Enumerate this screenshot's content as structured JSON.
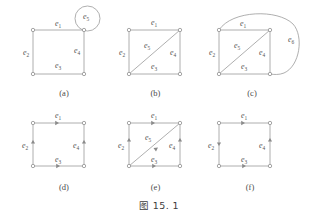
{
  "figure": {
    "caption": "图 15. 1",
    "caption_prefix": "图",
    "caption_number": "15. 1"
  },
  "labels": {
    "e1": "e",
    "e2": "e",
    "e3": "e",
    "e4": "e",
    "e5": "e",
    "e6": "e",
    "sub1": "1",
    "sub2": "2",
    "sub3": "3",
    "sub4": "4",
    "sub5": "5",
    "sub6": "6"
  },
  "colors": {
    "edge": "#9a9a9a",
    "vertex_stroke": "#8f8f8f",
    "vertex_fill": "#ffffff",
    "label": "#555555",
    "caption": "#3d3d3d",
    "background": "#ffffff"
  },
  "panels": [
    {
      "id": "a",
      "caption": "(a)",
      "type": "undirected",
      "description": "rectangle with self-loop at top-right vertex",
      "vertices": [
        "top-left",
        "top-right",
        "bottom-left",
        "bottom-right"
      ],
      "edges": [
        {
          "name": "e1",
          "label": "e",
          "sub": "1",
          "from": "top-left",
          "to": "top-right",
          "shape": "straight"
        },
        {
          "name": "e2",
          "label": "e",
          "sub": "2",
          "from": "top-left",
          "to": "bottom-left",
          "shape": "straight"
        },
        {
          "name": "e3",
          "label": "e",
          "sub": "3",
          "from": "bottom-left",
          "to": "bottom-right",
          "shape": "straight"
        },
        {
          "name": "e4",
          "label": "e",
          "sub": "4",
          "from": "top-right",
          "to": "bottom-right",
          "shape": "straight"
        },
        {
          "name": "e5",
          "label": "e",
          "sub": "5",
          "from": "top-right",
          "to": "top-right",
          "shape": "self-loop"
        }
      ]
    },
    {
      "id": "b",
      "caption": "(b)",
      "type": "undirected",
      "description": "rectangle with diagonal from bottom-left to top-right",
      "vertices": [
        "top-left",
        "top-right",
        "bottom-left",
        "bottom-right"
      ],
      "edges": [
        {
          "name": "e1",
          "label": "e",
          "sub": "1",
          "from": "top-left",
          "to": "top-right",
          "shape": "straight"
        },
        {
          "name": "e2",
          "label": "e",
          "sub": "2",
          "from": "top-left",
          "to": "bottom-left",
          "shape": "straight"
        },
        {
          "name": "e3",
          "label": "e",
          "sub": "3",
          "from": "bottom-left",
          "to": "bottom-right",
          "shape": "straight"
        },
        {
          "name": "e4",
          "label": "e",
          "sub": "4",
          "from": "top-right",
          "to": "bottom-right",
          "shape": "straight"
        },
        {
          "name": "e5",
          "label": "e",
          "sub": "5",
          "from": "bottom-left",
          "to": "top-right",
          "shape": "diagonal"
        }
      ]
    },
    {
      "id": "c",
      "caption": "(c)",
      "type": "undirected",
      "description": "rectangle with diagonal and large curved edge from top-left around to bottom-right",
      "vertices": [
        "top-left",
        "top-right",
        "bottom-left",
        "bottom-right"
      ],
      "edges": [
        {
          "name": "e1",
          "label": "e",
          "sub": "1",
          "from": "top-left",
          "to": "top-right",
          "shape": "straight"
        },
        {
          "name": "e2",
          "label": "e",
          "sub": "2",
          "from": "top-left",
          "to": "bottom-left",
          "shape": "straight"
        },
        {
          "name": "e3",
          "label": "e",
          "sub": "3",
          "from": "bottom-left",
          "to": "bottom-right",
          "shape": "straight"
        },
        {
          "name": "e4",
          "label": "e",
          "sub": "4",
          "from": "top-right",
          "to": "bottom-right",
          "shape": "straight"
        },
        {
          "name": "e5",
          "label": "e",
          "sub": "5",
          "from": "bottom-left",
          "to": "top-right",
          "shape": "diagonal"
        },
        {
          "name": "e6",
          "label": "e",
          "sub": "6",
          "from": "top-left",
          "to": "bottom-right",
          "shape": "outer-curve"
        }
      ]
    },
    {
      "id": "d",
      "caption": "(d)",
      "type": "directed",
      "description": "directed rectangle without diagonal",
      "vertices": [
        "top-left",
        "top-right",
        "bottom-left",
        "bottom-right"
      ],
      "edges": [
        {
          "name": "e1",
          "label": "e",
          "sub": "1",
          "from": "top-left",
          "to": "top-right",
          "shape": "straight",
          "arrow": "right"
        },
        {
          "name": "e2",
          "label": "e",
          "sub": "2",
          "from": "bottom-left",
          "to": "top-left",
          "shape": "straight",
          "arrow": "up"
        },
        {
          "name": "e3",
          "label": "e",
          "sub": "3",
          "from": "bottom-left",
          "to": "bottom-right",
          "shape": "straight",
          "arrow": "right"
        },
        {
          "name": "e4",
          "label": "e",
          "sub": "4",
          "from": "bottom-right",
          "to": "top-right",
          "shape": "straight",
          "arrow": "up"
        }
      ]
    },
    {
      "id": "e",
      "caption": "(e)",
      "type": "directed",
      "description": "directed rectangle with directed diagonal pointing up-right",
      "vertices": [
        "top-left",
        "top-right",
        "bottom-left",
        "bottom-right"
      ],
      "edges": [
        {
          "name": "e1",
          "label": "e",
          "sub": "1",
          "from": "top-left",
          "to": "top-right",
          "shape": "straight",
          "arrow": "right"
        },
        {
          "name": "e2",
          "label": "e",
          "sub": "2",
          "from": "bottom-left",
          "to": "top-left",
          "shape": "straight",
          "arrow": "up"
        },
        {
          "name": "e3",
          "label": "e",
          "sub": "3",
          "from": "bottom-left",
          "to": "bottom-right",
          "shape": "straight",
          "arrow": "right"
        },
        {
          "name": "e4",
          "label": "e",
          "sub": "4",
          "from": "bottom-right",
          "to": "top-right",
          "shape": "straight",
          "arrow": "up"
        },
        {
          "name": "e5",
          "label": "e",
          "sub": "5",
          "from": "bottom-left",
          "to": "top-right",
          "shape": "diagonal",
          "arrow": "up-right"
        }
      ]
    },
    {
      "id": "f",
      "caption": "(f)",
      "type": "directed",
      "description": "directed rectangle with left edge pointing down",
      "vertices": [
        "top-left",
        "top-right",
        "bottom-left",
        "bottom-right"
      ],
      "edges": [
        {
          "name": "e1",
          "label": "e",
          "sub": "1",
          "from": "top-left",
          "to": "top-right",
          "shape": "straight",
          "arrow": "right"
        },
        {
          "name": "e2",
          "label": "e",
          "sub": "2",
          "from": "top-left",
          "to": "bottom-left",
          "shape": "straight",
          "arrow": "down"
        },
        {
          "name": "e3",
          "label": "e",
          "sub": "3",
          "from": "bottom-left",
          "to": "bottom-right",
          "shape": "straight",
          "arrow": "right"
        },
        {
          "name": "e4",
          "label": "e",
          "sub": "4",
          "from": "bottom-right",
          "to": "top-right",
          "shape": "straight",
          "arrow": "up"
        }
      ]
    }
  ]
}
